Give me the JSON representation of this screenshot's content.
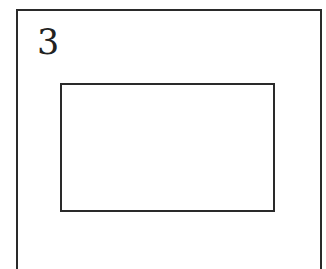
{
  "panel": {
    "number": "3"
  },
  "colors": {
    "stroke": "#2a2a2a",
    "text": "#222222",
    "background": "#ffffff"
  }
}
